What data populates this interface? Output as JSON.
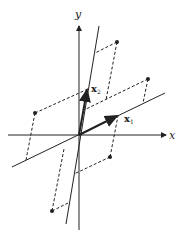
{
  "diagram": {
    "axes": {
      "x_label": "x",
      "y_label": "y"
    },
    "vectors": [
      {
        "name": "x1",
        "label": "x",
        "subscript": "1"
      },
      {
        "name": "x2",
        "label": "x",
        "subscript": "2"
      }
    ],
    "points_count": 5,
    "colors": {
      "ink": "#222222",
      "background": "#ffffff"
    }
  }
}
